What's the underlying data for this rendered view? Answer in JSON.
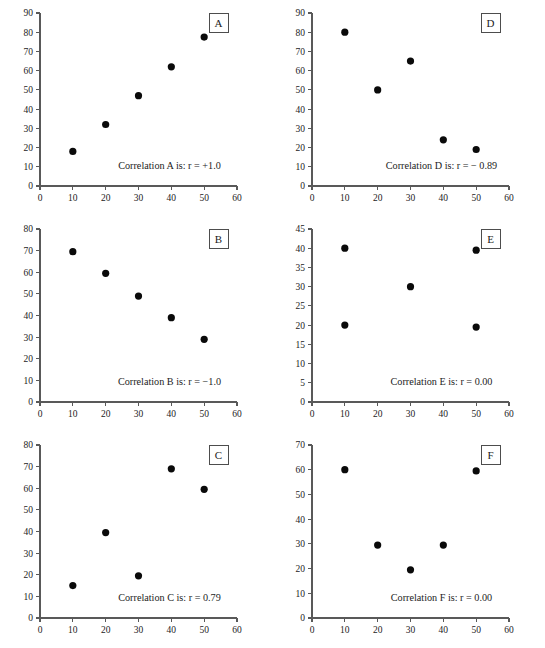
{
  "figure": {
    "title": "",
    "panel_count": 6,
    "columns": 2,
    "rows": 3,
    "marker_color": "#0a0a0a",
    "axis_color": "#595959"
  },
  "chart_data": [
    {
      "type": "scatter",
      "panel_label": "A",
      "title": "",
      "annotation": "Correlation A is: r = +1.0",
      "r": 1.0,
      "xlabel": "",
      "ylabel": "",
      "xlim": [
        0,
        60
      ],
      "ylim": [
        0,
        90
      ],
      "xticks": [
        0,
        10,
        20,
        30,
        40,
        50,
        60
      ],
      "yticks": [
        0,
        10,
        20,
        30,
        40,
        50,
        60,
        70,
        80,
        90
      ],
      "grid": false,
      "legend": "none",
      "x": [
        10,
        20,
        30,
        40,
        50
      ],
      "y": [
        18,
        32,
        47,
        62,
        77.5
      ]
    },
    {
      "type": "scatter",
      "panel_label": "D",
      "title": "",
      "annotation": "Correlation D is: r = − 0.89",
      "r": -0.89,
      "xlabel": "",
      "ylabel": "",
      "xlim": [
        0,
        60
      ],
      "ylim": [
        0,
        90
      ],
      "xticks": [
        0,
        10,
        20,
        30,
        40,
        50,
        60
      ],
      "yticks": [
        0,
        10,
        20,
        30,
        40,
        50,
        60,
        70,
        80,
        90
      ],
      "grid": false,
      "legend": "none",
      "x": [
        10,
        20,
        30,
        40,
        50
      ],
      "y": [
        80,
        50,
        65,
        24,
        19
      ]
    },
    {
      "type": "scatter",
      "panel_label": "B",
      "title": "",
      "annotation": "Correlation B is: r = −1.0",
      "r": -1.0,
      "xlabel": "",
      "ylabel": "",
      "xlim": [
        0,
        60
      ],
      "ylim": [
        0,
        80
      ],
      "xticks": [
        0,
        10,
        20,
        30,
        40,
        50,
        60
      ],
      "yticks": [
        0,
        10,
        20,
        30,
        40,
        50,
        60,
        70,
        80
      ],
      "grid": false,
      "legend": "none",
      "x": [
        10,
        20,
        30,
        40,
        50
      ],
      "y": [
        69.5,
        59.5,
        49,
        39,
        29
      ]
    },
    {
      "type": "scatter",
      "panel_label": "E",
      "title": "",
      "annotation": "Correlation E is: r = 0.00",
      "r": 0.0,
      "xlabel": "",
      "ylabel": "",
      "xlim": [
        0,
        60
      ],
      "ylim": [
        0,
        45
      ],
      "xticks": [
        0,
        10,
        20,
        30,
        40,
        50,
        60
      ],
      "yticks": [
        0,
        5,
        10,
        15,
        20,
        25,
        30,
        35,
        40,
        45
      ],
      "grid": false,
      "legend": "none",
      "x": [
        10,
        10,
        30,
        50,
        50
      ],
      "y": [
        40,
        20,
        30,
        39.5,
        19.5
      ]
    },
    {
      "type": "scatter",
      "panel_label": "C",
      "title": "",
      "annotation": "Correlation C is: r = 0.79",
      "r": 0.79,
      "xlabel": "",
      "ylabel": "",
      "xlim": [
        0,
        60
      ],
      "ylim": [
        0,
        80
      ],
      "xticks": [
        0,
        10,
        20,
        30,
        40,
        50,
        60
      ],
      "yticks": [
        0,
        10,
        20,
        30,
        40,
        50,
        60,
        70,
        80
      ],
      "grid": false,
      "legend": "none",
      "x": [
        10,
        20,
        30,
        40,
        50
      ],
      "y": [
        15,
        39.5,
        19.5,
        69,
        59.5
      ]
    },
    {
      "type": "scatter",
      "panel_label": "F",
      "title": "",
      "annotation": "Correlation F is: r = 0.00",
      "r": 0.0,
      "xlabel": "",
      "ylabel": "",
      "xlim": [
        0,
        60
      ],
      "ylim": [
        0,
        70
      ],
      "xticks": [
        0,
        10,
        20,
        30,
        40,
        50,
        60
      ],
      "yticks": [
        0,
        10,
        20,
        30,
        40,
        50,
        60,
        70
      ],
      "grid": false,
      "legend": "none",
      "x": [
        10,
        20,
        30,
        40,
        50
      ],
      "y": [
        60,
        29.5,
        19.5,
        29.5,
        59.5
      ]
    }
  ]
}
